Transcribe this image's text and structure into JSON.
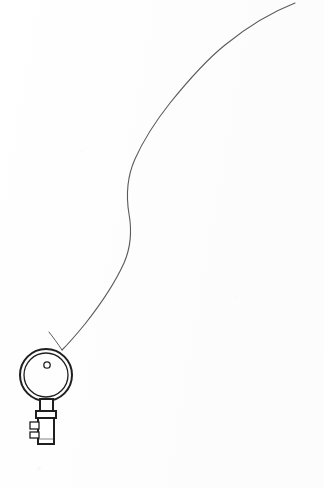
{
  "artwork": {
    "title": "Key on a String",
    "medium": "pen and ink line drawing",
    "background_color": "#fefefe",
    "canvas": {
      "width": 324,
      "height": 488
    }
  },
  "strokes": {
    "string_color": "#5a5a5a",
    "string_width": 1.1,
    "key_color": "#1f1f1f",
    "key_width": 2.0,
    "key_inner_width": 1.3
  },
  "string": {
    "label": "string",
    "path": "M 295 3 C 272 12, 247 27, 225 45 C 205 61, 187 82, 170 103 C 155 122, 143 141, 135 159 C 127 177, 126 196, 129 214 C 132 231, 131 247, 124 263 C 114 285, 100 305, 85 324 C 76 335, 68 344, 62 350",
    "tail_path": "M 62 350 C 58 344, 53 337, 49 332",
    "start_point": {
      "x": 295,
      "y": 3
    },
    "end_point": {
      "x": 62,
      "y": 350
    },
    "attaches_to": "key-bow-hole"
  },
  "key": {
    "label": "skeleton key",
    "bow": {
      "center": {
        "x": 46,
        "y": 375
      },
      "outer_radius": 26,
      "inner_radius": 22
    },
    "hole": {
      "center": {
        "x": 47,
        "y": 365
      },
      "radius": 3.2
    },
    "stem": {
      "x": 40,
      "y": 399,
      "width": 13,
      "height": 14
    },
    "collar": {
      "x": 36,
      "y": 411,
      "width": 20,
      "height": 7
    },
    "shank": {
      "x": 38,
      "y": 418,
      "width": 16,
      "height": 26
    },
    "teeth": [
      {
        "x": 30,
        "y": 422,
        "width": 9,
        "height": 7
      },
      {
        "x": 30,
        "y": 432,
        "width": 9,
        "height": 6
      }
    ]
  }
}
